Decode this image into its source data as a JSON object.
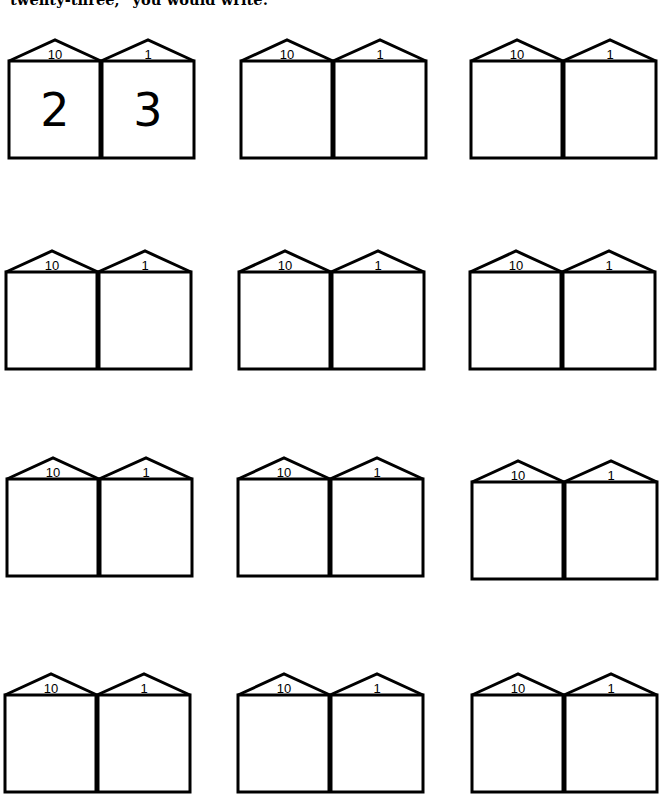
{
  "worksheet": {
    "instruction": "twenty-three,\" you would write:",
    "place_value_labels": {
      "tens": "10",
      "ones": "1"
    },
    "houses": [
      {
        "row": 1,
        "col": 1,
        "x": 7,
        "y": 38,
        "tens_value": "2",
        "ones_value": "3",
        "example": true
      },
      {
        "row": 1,
        "col": 2,
        "x": 239,
        "y": 38,
        "tens_value": "",
        "ones_value": ""
      },
      {
        "row": 1,
        "col": 3,
        "x": 469,
        "y": 38,
        "tens_value": "",
        "ones_value": ""
      },
      {
        "row": 2,
        "col": 1,
        "x": 4,
        "y": 249,
        "tens_value": "",
        "ones_value": ""
      },
      {
        "row": 2,
        "col": 2,
        "x": 237,
        "y": 249,
        "tens_value": "",
        "ones_value": ""
      },
      {
        "row": 2,
        "col": 3,
        "x": 468,
        "y": 249,
        "tens_value": "",
        "ones_value": ""
      },
      {
        "row": 3,
        "col": 1,
        "x": 5,
        "y": 456,
        "tens_value": "",
        "ones_value": ""
      },
      {
        "row": 3,
        "col": 2,
        "x": 236,
        "y": 456,
        "tens_value": "",
        "ones_value": ""
      },
      {
        "row": 3,
        "col": 3,
        "x": 470,
        "y": 459,
        "tens_value": "",
        "ones_value": ""
      },
      {
        "row": 4,
        "col": 1,
        "x": 3,
        "y": 672,
        "tens_value": "",
        "ones_value": ""
      },
      {
        "row": 4,
        "col": 2,
        "x": 236,
        "y": 672,
        "tens_value": "",
        "ones_value": ""
      },
      {
        "row": 4,
        "col": 3,
        "x": 470,
        "y": 672,
        "tens_value": "",
        "ones_value": ""
      }
    ]
  }
}
